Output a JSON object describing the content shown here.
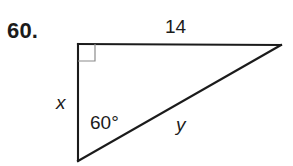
{
  "problem": {
    "number_label": "60."
  },
  "figure": {
    "type": "right-triangle-diagram",
    "stroke_color": "#1b1b1b",
    "right_angle_marker_color": "#8c8c8c",
    "background_color": "#ffffff",
    "vertices": {
      "top_left": [
        78,
        44
      ],
      "top_right": [
        281,
        45
      ],
      "bottom_left": [
        78,
        161
      ]
    },
    "right_angle_marker": {
      "at_vertex": "top_left",
      "size": 16
    },
    "labels": {
      "top_side": "14",
      "left_side": "x",
      "hypotenuse": "y",
      "bottom_angle": "60°"
    }
  }
}
